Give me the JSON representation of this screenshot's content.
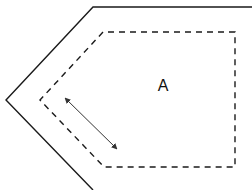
{
  "diagram": {
    "width": 252,
    "height": 190,
    "colors": {
      "background": "#ffffff",
      "stroke": "#1a1a1a",
      "arrow": "#333333",
      "label": "#111111"
    },
    "outer_boundary": {
      "style": "solid",
      "points": [
        [
          252,
          7
        ],
        [
          93,
          7
        ],
        [
          6,
          100
        ],
        [
          93,
          190
        ]
      ]
    },
    "inner_region": {
      "style": "dashed",
      "points": [
        [
          235,
          32
        ],
        [
          103,
          32
        ],
        [
          40,
          100
        ],
        [
          104,
          167
        ],
        [
          235,
          167
        ]
      ]
    },
    "dimension_arrow": {
      "style": "double-headed",
      "from": [
        65,
        98
      ],
      "to": [
        117,
        149
      ]
    },
    "labels": [
      {
        "text": "A",
        "x": 163,
        "y": 86
      }
    ]
  }
}
